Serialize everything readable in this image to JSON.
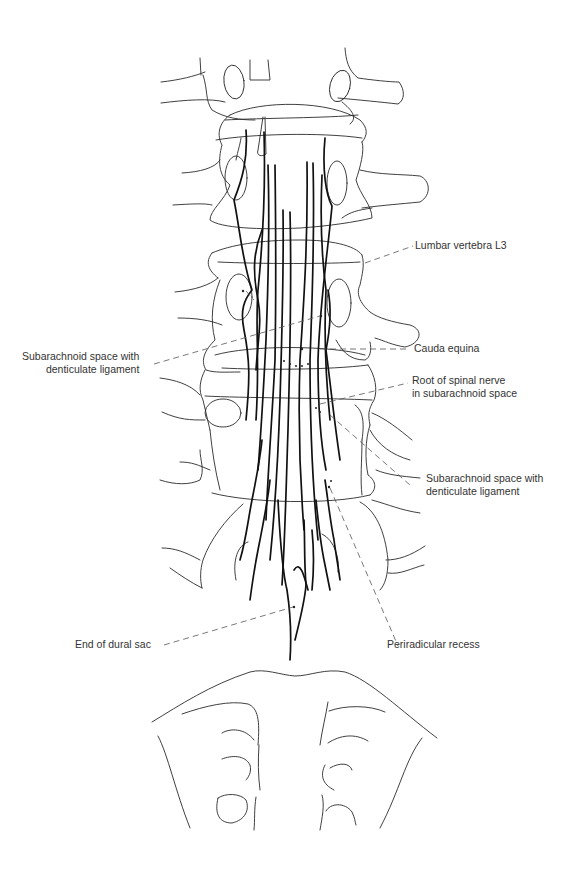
{
  "figure": {
    "labels": {
      "lumbar_vertebra": {
        "text": "Lumbar vertebra L3"
      },
      "cauda_equina": {
        "text": "Cauda equina"
      },
      "root_spinal_nerve": {
        "line1": "Root of spinal nerve",
        "line2": "in subarachnoid space"
      },
      "subarachnoid_left": {
        "line1": "Subarachnoid space with",
        "line2": "denticulate ligament"
      },
      "subarachnoid_right": {
        "line1": "Subarachnoid space with",
        "line2": "denticulate ligament"
      },
      "end_dural_sac": {
        "text": "End of dural sac"
      },
      "periradicular_recess": {
        "text": "Periradicular recess"
      }
    },
    "colors": {
      "background": "#ffffff",
      "line": "#2a2a2a",
      "nerve": "#111111",
      "leader": "#555555",
      "text": "#333333"
    }
  }
}
